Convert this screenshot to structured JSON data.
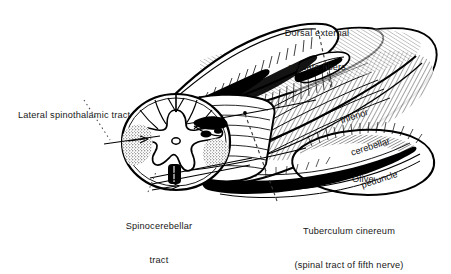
{
  "figure": {
    "kind": "anatomical-illustration",
    "background_color": "#ffffff",
    "ink_color": "#000000",
    "text_color": "#171717"
  },
  "labels": {
    "dorsal_external_arcuate_fibers": {
      "line1": "Dorsal external",
      "line2": "arcuate fibers"
    },
    "lateral_spinothalamic_tract": {
      "line1": "Lateral spinothalamic tract"
    },
    "inferior_cerebellar_peduncle": {
      "line1": "Inferior",
      "line2": "cerebellar",
      "line3": "peduncle"
    },
    "olive": {
      "line1": "Olive"
    },
    "spinocerebellar_tract": {
      "line1": "Spinocerebellar",
      "line2": "tract"
    },
    "tuberculum_cinereum": {
      "line1": "Tuberculum cinereum",
      "line2": "(spinal tract of fifth nerve)"
    }
  }
}
